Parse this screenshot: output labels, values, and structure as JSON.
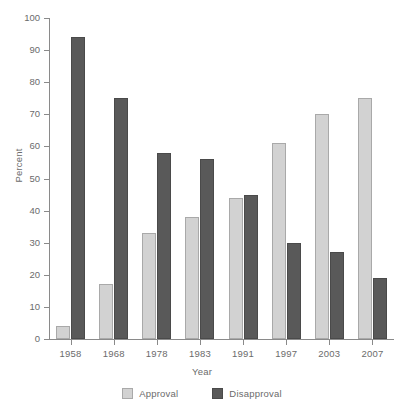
{
  "chart_data": {
    "type": "bar",
    "title": "",
    "subtitle": "",
    "xlabel": "Year",
    "ylabel": "Percent",
    "categories": [
      "1958",
      "1968",
      "1978",
      "1983",
      "1991",
      "1997",
      "2003",
      "2007"
    ],
    "series": [
      {
        "name": "Approval",
        "color": "#d2d2d2",
        "values": [
          4,
          17,
          33,
          38,
          44,
          61,
          70,
          75
        ]
      },
      {
        "name": "Disapproval",
        "color": "#595959",
        "values": [
          94,
          75,
          58,
          56,
          45,
          30,
          27,
          19
        ]
      }
    ],
    "ylim": [
      0,
      100
    ],
    "yticks": [
      0,
      10,
      20,
      30,
      40,
      50,
      60,
      70,
      80,
      90,
      100
    ],
    "ytick_labels": [
      "0",
      "10",
      "20",
      "30",
      "40",
      "50",
      "60",
      "70",
      "80",
      "90",
      "100"
    ],
    "grid": false,
    "legend_position": "bottom",
    "legend_entries": [
      "Approval",
      "Disapproval"
    ],
    "annotations": [],
    "axis_label_color": "#6b6b6b",
    "axis_line_color": "#8a8a8a",
    "background_color": "#ffffff"
  }
}
